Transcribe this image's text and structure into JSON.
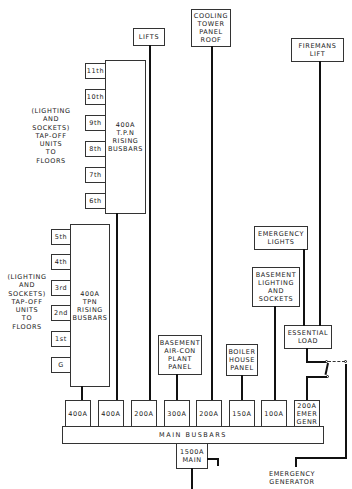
{
  "upper_riser": {
    "busbar_label": "400A\nT.P.N\nRISING\nBUSBARS",
    "floors": [
      "11th",
      "10th",
      "9th",
      "8th",
      "7th",
      "6th"
    ],
    "note": "(LIGHTING\nAND\nSOCKETS)\nTAP-OFF\nUNITS\nTO\nFLOORS"
  },
  "lower_riser": {
    "busbar_label": "400A\nTPN\nRISING\nBUSBARS",
    "floors": [
      "5th",
      "4th",
      "3rd",
      "2nd",
      "1st",
      "G"
    ],
    "note": "(LIGHTING\nAND\nSOCKETS)\nTAP-OFF\nUNITS\nTO\nFLOORS"
  },
  "loads": {
    "lifts": "LIFTS",
    "cooling_tower": "COOLING\nTOWER\nPANEL\nROOF",
    "firemans_lift": "FIREMANS\nLIFT",
    "emergency_lights": "EMERGENCY\nLIGHTS",
    "basement_lighting": "BASEMENT\nLIGHTING\nAND\nSOCKETS",
    "essential_load": "ESSENTIAL\nLOAD",
    "basement_aircon": "BASEMENT\nAIR-CON\nPLANT\nPANEL",
    "boiler_house": "BOILER\nHOUSE\nPANEL"
  },
  "breakers": [
    "400A",
    "400A",
    "200A",
    "300A",
    "200A",
    "150A",
    "100A",
    "200A\nEMER\nGENR"
  ],
  "main_busbars": "MAIN  BUSBARS",
  "main_breaker": "1500A\nMAIN",
  "emergency_generator": "EMERGENCY\nGENERATOR"
}
